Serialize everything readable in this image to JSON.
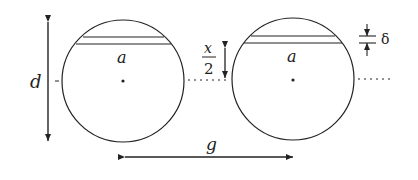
{
  "diagram": {
    "labels": {
      "diameter": "d",
      "chord_left": "a",
      "chord_right": "a",
      "half_x_num": "x",
      "half_x_den": "2",
      "gap": "g",
      "thickness": "δ"
    },
    "colors": {
      "stroke": "#222222",
      "background": "#ffffff"
    }
  }
}
